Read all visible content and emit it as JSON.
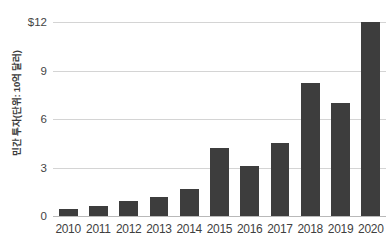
{
  "chart_data": {
    "type": "bar",
    "title": "",
    "subtitle": "",
    "xlabel": "",
    "ylabel": "민간 투자(단위: 10억 달러)",
    "categories": [
      "2010",
      "2011",
      "2012",
      "2013",
      "2014",
      "2015",
      "2016",
      "2017",
      "2018",
      "2019",
      "2020"
    ],
    "values": [
      0.45,
      0.6,
      0.9,
      1.2,
      1.7,
      4.2,
      3.1,
      4.5,
      8.2,
      7.0,
      12.0
    ],
    "series": [
      {
        "name": "민간 투자",
        "values": [
          0.45,
          0.6,
          0.9,
          1.2,
          1.7,
          4.2,
          3.1,
          4.5,
          8.2,
          7.0,
          12.0
        ]
      }
    ],
    "ylim": [
      0,
      12
    ],
    "y_ticks": [
      0,
      3,
      6,
      9,
      12
    ],
    "y_tick_labels": [
      "0",
      "3",
      "6",
      "9",
      "$12"
    ],
    "grid": true,
    "legend": false,
    "legend_position": "none",
    "bar_color": "#3d3d3d",
    "gridline_color": "#d4d4d4",
    "axis_color": "#b9b9b9",
    "background_color": "#ffffff"
  }
}
